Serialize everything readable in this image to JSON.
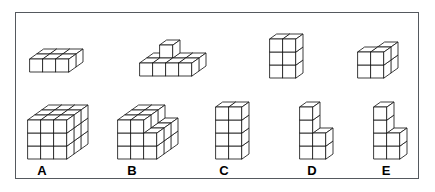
{
  "figure": {
    "kind": "spatial-reasoning-cube-puzzle",
    "border_color": "#55595e",
    "background_color": "#ffffff",
    "line_color": "#1a1a1a",
    "face_fill": "#ffffff"
  },
  "projection": {
    "cube_width": 13,
    "cube_height": 13,
    "depth_x": 7,
    "depth_y": -5
  },
  "prompt_row": {
    "label": "prompt-shapes",
    "shapes": [
      {
        "id": "prompt-1",
        "name": "flat-slab-3x2x1",
        "origin_x": 30,
        "origin_y": 72,
        "cells": [
          [
            0,
            0,
            0
          ],
          [
            1,
            0,
            0
          ],
          [
            2,
            0,
            0
          ],
          [
            0,
            1,
            0
          ],
          [
            1,
            1,
            0
          ],
          [
            2,
            1,
            0
          ]
        ]
      },
      {
        "id": "prompt-2",
        "name": "l-slab-4x2x1-with-riser",
        "origin_x": 140,
        "origin_y": 76,
        "cells": [
          [
            0,
            0,
            0
          ],
          [
            1,
            0,
            0
          ],
          [
            2,
            0,
            0
          ],
          [
            3,
            0,
            0
          ],
          [
            0,
            1,
            0
          ],
          [
            1,
            1,
            0
          ],
          [
            2,
            1,
            0
          ],
          [
            3,
            1,
            0
          ],
          [
            1,
            1,
            1
          ]
        ]
      },
      {
        "id": "prompt-3",
        "name": "tower-2x1x3",
        "origin_x": 270,
        "origin_y": 78,
        "cells": [
          [
            0,
            0,
            0
          ],
          [
            1,
            0,
            0
          ],
          [
            0,
            0,
            1
          ],
          [
            1,
            0,
            1
          ],
          [
            0,
            0,
            2
          ],
          [
            1,
            0,
            2
          ]
        ]
      },
      {
        "id": "prompt-4",
        "name": "block-2x2x2-notched",
        "origin_x": 358,
        "origin_y": 78,
        "cells": [
          [
            0,
            0,
            0
          ],
          [
            1,
            0,
            0
          ],
          [
            0,
            1,
            0
          ],
          [
            1,
            1,
            0
          ],
          [
            0,
            0,
            1
          ],
          [
            1,
            0,
            1
          ],
          [
            1,
            1,
            1
          ]
        ]
      }
    ]
  },
  "answer_row": {
    "label": "answer-options",
    "options": [
      {
        "id": "option-a",
        "letter": "A",
        "name": "cube-3x3x3",
        "origin_x": 28,
        "origin_y": 159,
        "label_x": 31,
        "label_y": 164,
        "cells": [
          [
            0,
            0,
            0
          ],
          [
            1,
            0,
            0
          ],
          [
            2,
            0,
            0
          ],
          [
            0,
            1,
            0
          ],
          [
            1,
            1,
            0
          ],
          [
            2,
            1,
            0
          ],
          [
            0,
            2,
            0
          ],
          [
            1,
            2,
            0
          ],
          [
            2,
            2,
            0
          ],
          [
            0,
            0,
            1
          ],
          [
            1,
            0,
            1
          ],
          [
            2,
            0,
            1
          ],
          [
            0,
            1,
            1
          ],
          [
            1,
            1,
            1
          ],
          [
            2,
            1,
            1
          ],
          [
            0,
            2,
            1
          ],
          [
            1,
            2,
            1
          ],
          [
            2,
            2,
            1
          ],
          [
            0,
            0,
            2
          ],
          [
            1,
            0,
            2
          ],
          [
            2,
            0,
            2
          ],
          [
            0,
            1,
            2
          ],
          [
            1,
            1,
            2
          ],
          [
            2,
            1,
            2
          ],
          [
            0,
            2,
            2
          ],
          [
            1,
            2,
            2
          ],
          [
            2,
            2,
            2
          ]
        ]
      },
      {
        "id": "option-b",
        "letter": "B",
        "name": "stepped-block-3x3",
        "origin_x": 118,
        "origin_y": 159,
        "label_x": 121,
        "label_y": 164,
        "cells": [
          [
            0,
            0,
            0
          ],
          [
            1,
            0,
            0
          ],
          [
            2,
            0,
            0
          ],
          [
            0,
            1,
            0
          ],
          [
            1,
            1,
            0
          ],
          [
            2,
            1,
            0
          ],
          [
            0,
            2,
            0
          ],
          [
            1,
            2,
            0
          ],
          [
            2,
            2,
            0
          ],
          [
            0,
            0,
            1
          ],
          [
            1,
            0,
            1
          ],
          [
            2,
            0,
            1
          ],
          [
            0,
            1,
            1
          ],
          [
            1,
            1,
            1
          ],
          [
            2,
            1,
            1
          ],
          [
            0,
            2,
            1
          ],
          [
            1,
            2,
            1
          ],
          [
            2,
            2,
            1
          ],
          [
            0,
            0,
            2
          ],
          [
            1,
            0,
            2
          ],
          [
            0,
            1,
            2
          ],
          [
            1,
            1,
            2
          ],
          [
            0,
            2,
            2
          ],
          [
            1,
            2,
            2
          ]
        ]
      },
      {
        "id": "option-c",
        "letter": "C",
        "name": "tower-2x1x4",
        "origin_x": 216,
        "origin_y": 159,
        "label_x": 213,
        "label_y": 164,
        "cells": [
          [
            0,
            0,
            0
          ],
          [
            1,
            0,
            0
          ],
          [
            0,
            0,
            1
          ],
          [
            1,
            0,
            1
          ],
          [
            0,
            0,
            2
          ],
          [
            1,
            0,
            2
          ],
          [
            0,
            0,
            3
          ],
          [
            1,
            0,
            3
          ]
        ]
      },
      {
        "id": "option-d",
        "letter": "D",
        "name": "l-stack-tall-left",
        "origin_x": 300,
        "origin_y": 159,
        "label_x": 301,
        "label_y": 164,
        "cells": [
          [
            0,
            0,
            0
          ],
          [
            1,
            0,
            0
          ],
          [
            0,
            0,
            1
          ],
          [
            1,
            0,
            1
          ],
          [
            0,
            0,
            2
          ],
          [
            0,
            0,
            3
          ]
        ]
      },
      {
        "id": "option-e",
        "letter": "E",
        "name": "staircase-stack",
        "origin_x": 374,
        "origin_y": 159,
        "label_x": 375,
        "label_y": 164,
        "cells": [
          [
            0,
            0,
            0
          ],
          [
            1,
            0,
            0
          ],
          [
            0,
            0,
            1
          ],
          [
            1,
            0,
            1
          ],
          [
            0,
            0,
            2
          ],
          [
            0,
            0,
            3
          ]
        ]
      }
    ]
  }
}
